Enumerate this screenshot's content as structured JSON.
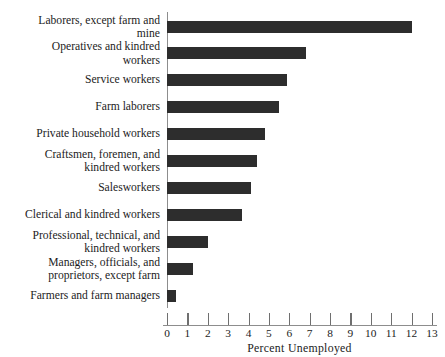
{
  "scan": {
    "top_right_artifact": ""
  },
  "chart_data": {
    "type": "bar",
    "orientation": "horizontal",
    "title": "",
    "xlabel": "Percent Unemployed",
    "ylabel": "",
    "xlim": [
      0,
      13
    ],
    "xticks": [
      0,
      1,
      2,
      3,
      4,
      5,
      6,
      7,
      8,
      9,
      10,
      11,
      12,
      13
    ],
    "xtick_labels": [
      "0",
      "1",
      "2",
      "3",
      "4",
      "5",
      "6",
      "7",
      "8",
      "9",
      "10",
      "11",
      "12",
      "13"
    ],
    "grid": false,
    "legend": null,
    "bar_color": "#2d2d2d",
    "axis_color": "#8d8d8d",
    "categories": [
      "Laborers, except farm and\nmine",
      "Operatives and kindred\nworkers",
      "Service workers",
      "Farm laborers",
      "Private household workers",
      "Craftsmen, foremen, and\nkindred workers",
      "Salesworkers",
      "Clerical and kindred workers",
      "Professional, technical, and\nkindred workers",
      "Managers, officials, and\nproprietors, except farm",
      "Farmers and farm managers"
    ],
    "values": [
      12.0,
      6.8,
      5.9,
      5.5,
      4.8,
      4.4,
      4.1,
      3.7,
      2.0,
      1.3,
      0.45
    ]
  }
}
